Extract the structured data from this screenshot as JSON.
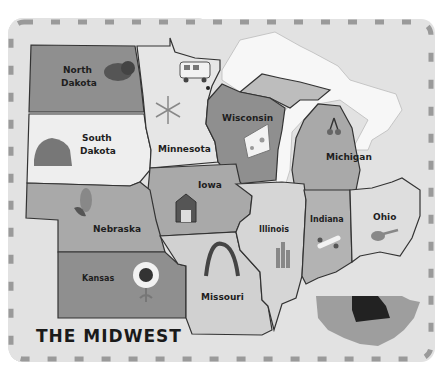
{
  "map": {
    "title": "THE MIDWEST",
    "states": [
      {
        "name": "North Dakota",
        "line1": "North",
        "line2": "Dakota",
        "icon": "bison-icon"
      },
      {
        "name": "South Dakota",
        "line1": "South",
        "line2": "Dakota",
        "icon": "mount-rushmore-icon"
      },
      {
        "name": "Minnesota",
        "label": "Minnesota",
        "icon": "snowflake-icon"
      },
      {
        "name": "Wisconsin",
        "label": "Wisconsin",
        "icon": "cheese-icon"
      },
      {
        "name": "Michigan",
        "label": "Michigan",
        "icon": "cherries-icon"
      },
      {
        "name": "Iowa",
        "label": "Iowa",
        "icon": "barn-icon"
      },
      {
        "name": "Nebraska",
        "label": "Nebraska",
        "icon": "corn-icon"
      },
      {
        "name": "Kansas",
        "label": "Kansas",
        "icon": "sunflower-icon"
      },
      {
        "name": "Missouri",
        "label": "Missouri",
        "icon": "gateway-arch-icon"
      },
      {
        "name": "Illinois",
        "label": "Illinois",
        "icon": "skyline-icon"
      },
      {
        "name": "Indiana",
        "label": "Indiana",
        "icon": "race-car-icon"
      },
      {
        "name": "Ohio",
        "label": "Ohio",
        "icon": "guitar-icon"
      }
    ],
    "extras": [
      "bus-icon",
      "great-lakes",
      "usa-inset-map"
    ]
  },
  "colors": {
    "background": "#e2e2e2",
    "dash_border": "#9a9a9a",
    "dark_state": "#8f8f8f",
    "medium_state": "#a9a9a9",
    "light_state": "#c9c9c9",
    "pale_state": "#eeeeee",
    "lake": "#f7f7f7"
  }
}
